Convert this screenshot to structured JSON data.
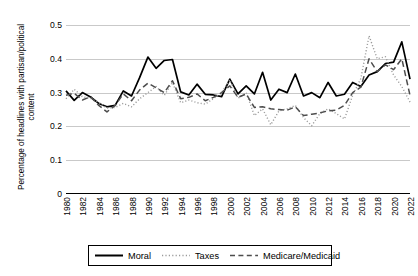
{
  "chart_data": {
    "type": "line",
    "title": "",
    "xlabel": "",
    "ylabel": "Percentage of headlines with partisan/political content",
    "ylim": [
      0,
      0.5
    ],
    "ytick_labels": [
      "0",
      "0.1",
      "0.2",
      "0.3",
      "0.4",
      "0.5"
    ],
    "ytick_values": [
      0,
      0.1,
      0.2,
      0.3,
      0.4,
      0.5
    ],
    "grid": true,
    "legend_position": "bottom",
    "x": [
      1980,
      1981,
      1982,
      1983,
      1984,
      1985,
      1986,
      1987,
      1988,
      1989,
      1990,
      1991,
      1992,
      1993,
      1994,
      1995,
      1996,
      1997,
      1998,
      1999,
      2000,
      2001,
      2002,
      2003,
      2004,
      2005,
      2006,
      2007,
      2008,
      2009,
      2010,
      2011,
      2012,
      2013,
      2014,
      2015,
      2016,
      2017,
      2018,
      2019,
      2020,
      2021,
      2022
    ],
    "xtick_labels": [
      "1980",
      "1982",
      "1984",
      "1986",
      "1988",
      "1990",
      "1992",
      "1994",
      "1996",
      "1998",
      "2000",
      "2002",
      "2004",
      "2006",
      "2008",
      "2010",
      "2012",
      "2014",
      "2016",
      "2018",
      "2020",
      "2022"
    ],
    "series": [
      {
        "name": "Moral",
        "style": "solid",
        "color": "#000000",
        "values": [
          0.305,
          0.277,
          0.3,
          0.287,
          0.268,
          0.258,
          0.262,
          0.305,
          0.29,
          0.345,
          0.405,
          0.372,
          0.395,
          0.398,
          0.302,
          0.293,
          0.325,
          0.295,
          0.293,
          0.288,
          0.34,
          0.296,
          0.32,
          0.296,
          0.36,
          0.278,
          0.31,
          0.3,
          0.355,
          0.29,
          0.3,
          0.285,
          0.33,
          0.29,
          0.295,
          0.33,
          0.318,
          0.352,
          0.362,
          0.386,
          0.39,
          0.45,
          0.34
        ]
      },
      {
        "name": "Taxes",
        "style": "dotted",
        "color": "#9a9a9a",
        "values": [
          0.282,
          0.31,
          0.288,
          0.283,
          0.271,
          0.254,
          0.256,
          0.268,
          0.258,
          0.282,
          0.3,
          0.318,
          0.292,
          0.33,
          0.27,
          0.278,
          0.27,
          0.266,
          0.282,
          0.3,
          0.338,
          0.283,
          0.3,
          0.232,
          0.252,
          0.205,
          0.246,
          0.252,
          0.262,
          0.226,
          0.202,
          0.238,
          0.252,
          0.238,
          0.222,
          0.292,
          0.342,
          0.468,
          0.4,
          0.406,
          0.352,
          0.318,
          0.272
        ]
      },
      {
        "name": "Medicare/Medicaid",
        "style": "dashed",
        "color": "#4d4d4d",
        "values": [
          0.292,
          0.298,
          0.278,
          0.288,
          0.262,
          0.243,
          0.262,
          0.296,
          0.276,
          0.308,
          0.328,
          0.314,
          0.3,
          0.335,
          0.282,
          0.286,
          0.296,
          0.276,
          0.286,
          0.3,
          0.32,
          0.286,
          0.296,
          0.256,
          0.258,
          0.252,
          0.25,
          0.248,
          0.258,
          0.232,
          0.236,
          0.24,
          0.246,
          0.248,
          0.262,
          0.3,
          0.316,
          0.4,
          0.362,
          0.382,
          0.368,
          0.4,
          0.292
        ]
      }
    ]
  },
  "legend": {
    "items": [
      {
        "label": "Moral",
        "style": "solid"
      },
      {
        "label": "Taxes",
        "style": "dotted"
      },
      {
        "label": "Medicare/Medicaid",
        "style": "dashed"
      }
    ]
  }
}
